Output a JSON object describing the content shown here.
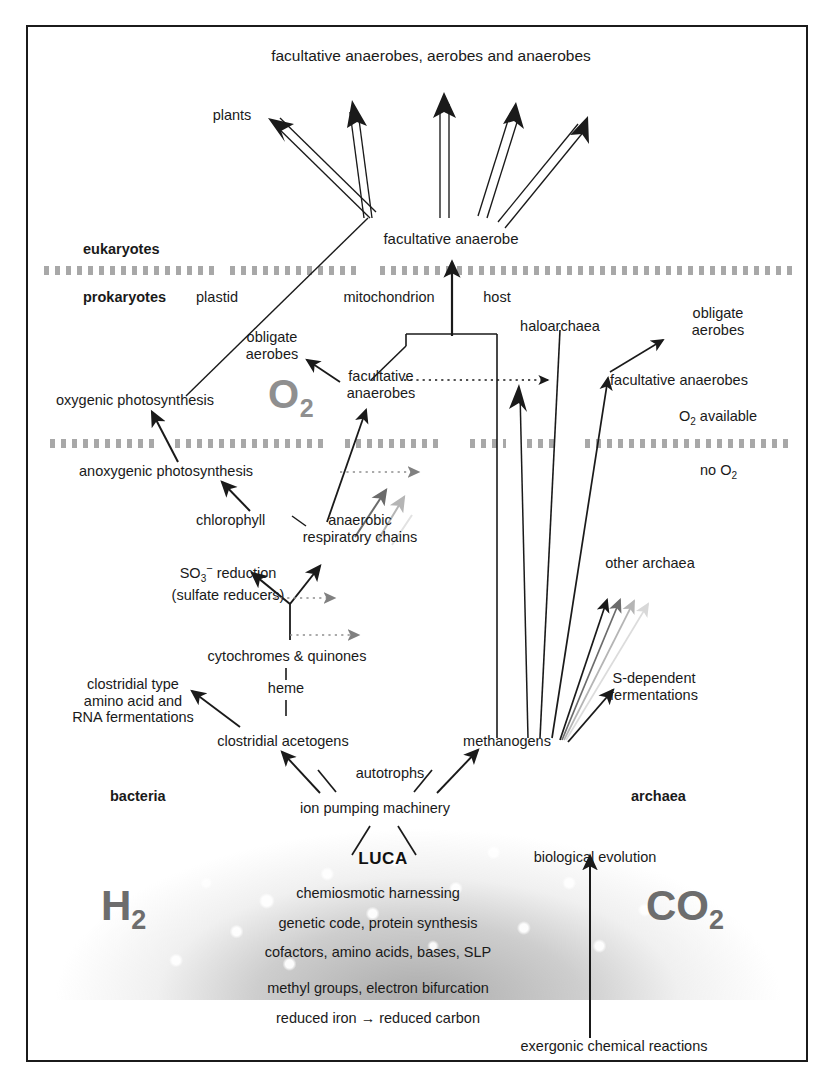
{
  "diagram": {
    "top_node": "facultative anaerobes, aerobes and anaerobes",
    "plants": "plants",
    "facultative_anaerobe": "facultative anaerobe",
    "eukaryotes": "eukaryotes",
    "prokaryotes": "prokaryotes",
    "plastid": "plastid",
    "mitochondrion": "mitochondrion",
    "host": "host",
    "haloarchaea": "haloarchaea",
    "obligate_aerobes_right": "obligate\naerobes",
    "obligate_aerobes_left": "obligate\naerobes",
    "facultative_anaerobes_left": "facultative\nanaerobes",
    "facultative_anaerobes_right": "facultative anaerobes",
    "oxygenic_photosynthesis": "oxygenic photosynthesis",
    "anoxygenic_photosynthesis": "anoxygenic photosynthesis",
    "chlorophyll": "chlorophyll",
    "anaerobic_respiratory_chains": "anaerobic\nrespiratory chains",
    "so3_reduction": "SO3- reduction\n(sulfate reducers)",
    "cytochromes_quinones": "cytochromes & quinones",
    "heme": "heme",
    "clostridial_fermentations": "clostridial type\namino acid and\nRNA fermentations",
    "clostridial_acetogens": "clostridial acetogens",
    "methanogens": "methanogens",
    "other_archaea": "other archaea",
    "s_dependent_fermentations": "S-dependent\nfermentations",
    "autotrophs": "autotrophs",
    "ion_pumping_machinery": "ion pumping machinery",
    "bacteria": "bacteria",
    "archaea": "archaea",
    "o2_big": "O",
    "o2_big_sub": "2",
    "o2_available": "O2 available",
    "no_o2": "no O2",
    "luca": "LUCA",
    "biological_evolution": "biological evolution",
    "cloud_lines": [
      "chemiosmotic harnessing",
      "genetic code, protein synthesis",
      "cofactors, amino acids, bases, SLP",
      "methyl groups, electron bifurcation",
      "reduced iron → reduced carbon"
    ],
    "exergonic": "exergonic chemical reactions",
    "h2": "H",
    "h2_sub": "2",
    "co2": "CO",
    "co2_sub": "2",
    "colors": {
      "ink": "#1a1a1a",
      "dash_band": "#a8a8a8",
      "gray_label": "#8f8f8f",
      "arrow_mid_gray": "#6b6b6b",
      "arrow_light_gray": "#b5b5b5",
      "arrow_faint_gray": "#d8d8d8",
      "frame": "#1b1b1b"
    }
  }
}
